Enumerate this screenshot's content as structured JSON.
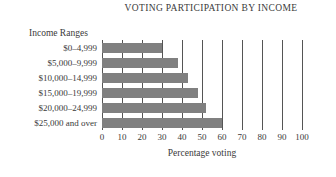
{
  "chart_data": {
    "type": "bar",
    "orientation": "horizontal",
    "title": "VOTING PARTICIPATION BY INCOME",
    "xlabel": "Percentage voting",
    "ylabel": "Income Ranges",
    "categories": [
      "$0–4,999",
      "$5,000–9,999",
      "$10,000–14,999",
      "$15,000–19,999",
      "$20,000–24,999",
      "$25,000 and over"
    ],
    "values": [
      30,
      38,
      43,
      48,
      52,
      60
    ],
    "xlim": [
      0,
      100
    ],
    "xticks": [
      0,
      10,
      20,
      30,
      40,
      50,
      60,
      70,
      80,
      90,
      100
    ],
    "xtick_labels": [
      "0",
      "10",
      "20",
      "30",
      "40",
      "50",
      "60",
      "70",
      "80",
      "90",
      "100"
    ],
    "grid": true,
    "grid_axis": "x",
    "legend": false,
    "bar_color": "#808080",
    "grid_color": "#555555",
    "text_color": "#3a3a3a",
    "background": "#ffffff"
  }
}
